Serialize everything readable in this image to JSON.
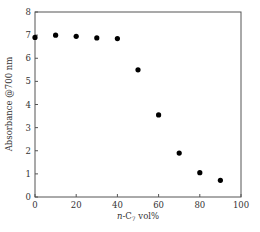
{
  "chart_data": {
    "type": "scatter",
    "title": "",
    "xlabel": "n-C7 vol%",
    "xlabel_parts": {
      "italic": "n",
      "base": "-C",
      "sub": "7",
      "rest": " vol%"
    },
    "ylabel": "Absorbance @700 nm",
    "xlim": [
      0,
      100
    ],
    "ylim": [
      0,
      8
    ],
    "xticks": [
      0,
      20,
      40,
      60,
      80,
      100
    ],
    "yticks": [
      0,
      1,
      2,
      3,
      4,
      5,
      6,
      7,
      8
    ],
    "grid": false,
    "legend": null,
    "series": [
      {
        "name": "Absorbance",
        "marker": "filled-circle",
        "color": "#000000",
        "x": [
          0,
          10,
          20,
          30,
          40,
          50,
          60,
          70,
          80,
          90
        ],
        "y": [
          6.9,
          7.0,
          6.95,
          6.88,
          6.85,
          5.5,
          3.55,
          1.9,
          1.05,
          0.72
        ]
      }
    ]
  }
}
